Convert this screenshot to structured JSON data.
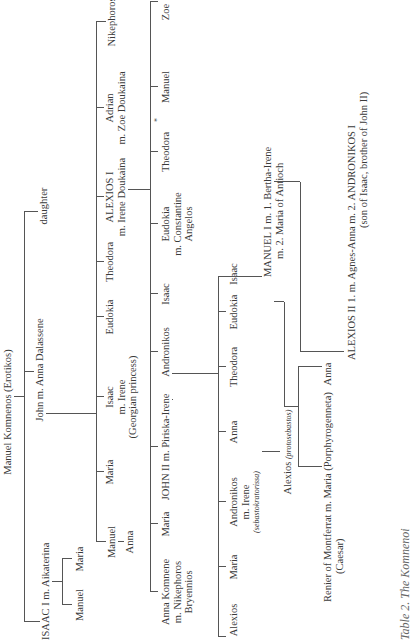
{
  "diagram": {
    "type": "family-tree",
    "orientation": "rotated-90-ccw",
    "caption": "Table 2. The Komnenoi",
    "root": {
      "label": "Manuel Komnenos (Erotikos)"
    },
    "gen1": {
      "isaac": "ISAAC I m. Aikaterina",
      "john": "John m. Anna Dalassene",
      "daughter": "daughter"
    },
    "gen2_isaac": {
      "manuel": "Manuel",
      "maria": "Maria"
    },
    "gen2_john": {
      "manuel": "Manuel",
      "maria": "Maria",
      "isaac": "Isaac",
      "isaac_m": "m. Irene",
      "isaac_note": "(Georgian princess)",
      "eudokia": "Eudokia",
      "theodora": "Theodora",
      "alexios": "ALEXIOS I",
      "alexios_m": "m. Irene Doukaina",
      "adrian": "Adrian",
      "adrian_m": "m. Zoe Doukaina",
      "nikephoros": "Nikephoros"
    },
    "gen3_manuel": {
      "anna": "Anna"
    },
    "gen3_alexios": {
      "anna": "Anna Komnene",
      "anna_m": "m. Nikephoros",
      "anna_m2": "Bryennios",
      "maria": "Maria",
      "john": "JOHN II m. Piriska-Irene",
      "andronikos": "Andronikos",
      "isaac": "Isaac",
      "eudokia": "Eudokia",
      "eudokia_m": "m. Constantine",
      "eudokia_m2": "Angelos",
      "theodora": "Theodora",
      "manuel": "Manuel",
      "zoe": "Zoe",
      "asterisk": "*"
    },
    "gen4_john": {
      "alexios": "Alexios",
      "maria": "Maria",
      "andronikos": "Andronikos",
      "andronikos_m": "m. Irene",
      "andronikos_title": "(sebastokratorissa)",
      "anna": "Anna",
      "theodora": "Theodora",
      "eudokia": "Eudokia",
      "isaac": "Isaac",
      "manuel": "MANUEL I m. 1. Bertha-Irene",
      "manuel_m2": "m. 2. Maria of Antioch"
    },
    "gen5": {
      "alexios_prot": "Alexios",
      "alexios_prot_title": "(protosebastos)",
      "renier": "Renier of Montferrat m. Maria (Porphyrogenneta)",
      "renier_title": "(Caesar)",
      "anna": "Anna",
      "alexios_ii": "ALEXIOS II 1. m. Agnes-Anna m. 2. ANDRONIKOS I",
      "alexios_ii_note": "(son of Isaac, brother of John II)"
    }
  }
}
